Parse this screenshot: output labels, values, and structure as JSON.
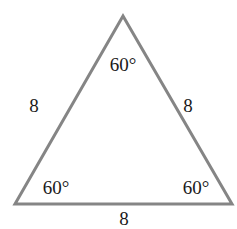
{
  "diagram": {
    "type": "equilateral-triangle",
    "stroke_color": "#858585",
    "text_color": "#1a1a1a",
    "vertices": {
      "top": [
        123,
        16
      ],
      "bottom_left": [
        15,
        204
      ],
      "bottom_right": [
        232,
        204
      ]
    },
    "angles": {
      "top": "60°",
      "bottom_left": "60°",
      "bottom_right": "60°"
    },
    "sides": {
      "left": "8",
      "right": "8",
      "bottom": "8"
    }
  }
}
